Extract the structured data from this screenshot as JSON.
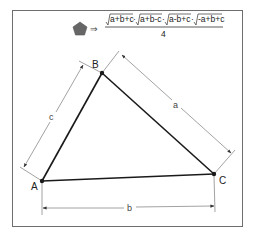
{
  "diagram": {
    "formula": {
      "shape_icon": "pentagon-icon",
      "arrow": "⇒",
      "numerator_terms": [
        "a+b+c",
        "a+b-c",
        "a-b+c",
        "-a+b+c"
      ],
      "operator": "·",
      "denominator": "4"
    },
    "vertices": {
      "A": "A",
      "B": "B",
      "C": "C"
    },
    "sides": {
      "a": "a",
      "b": "b",
      "c": "c"
    },
    "colors": {
      "triangle": "#1a1a1a",
      "dimension": "#8a8a8a",
      "pentagon": "#666666",
      "frame": "#6e6e6e"
    }
  }
}
